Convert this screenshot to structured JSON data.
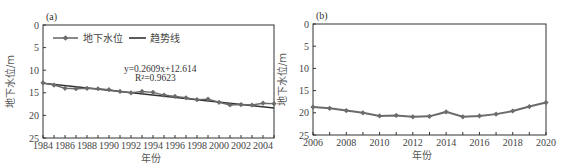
{
  "chart_data": [
    {
      "type": "line",
      "panel": "(a)",
      "title": "",
      "xlabel": "年份",
      "ylabel": "地下水位/m",
      "ylim": [
        0,
        25
      ],
      "y_inverted": true,
      "xlim": [
        1984,
        2005
      ],
      "x_ticks": [
        "1984",
        "1986",
        "1988",
        "1990",
        "1992",
        "1994",
        "1996",
        "1998",
        "2000",
        "2002",
        "2004"
      ],
      "y_ticks": [
        "0",
        "5",
        "10",
        "15",
        "20",
        "25"
      ],
      "legend": [
        "地下水位",
        "趋势线"
      ],
      "legend_position": "top-left inside",
      "annotation": {
        "equation": "y=0.2609x+12.614",
        "r2": "R²=0.9623"
      },
      "x": [
        1984,
        1985,
        1986,
        1987,
        1988,
        1989,
        1990,
        1991,
        1992,
        1993,
        1994,
        1995,
        1996,
        1997,
        1998,
        1999,
        2000,
        2001,
        2002,
        2003,
        2004,
        2005
      ],
      "series": [
        {
          "name": "地下水位",
          "marker": "diamond",
          "values": [
            12.8,
            13.3,
            14.0,
            14.1,
            14.0,
            14.1,
            14.3,
            14.7,
            15.0,
            14.7,
            14.9,
            15.5,
            15.8,
            16.1,
            16.5,
            16.4,
            17.1,
            17.7,
            17.6,
            17.7,
            17.3,
            17.4
          ]
        },
        {
          "name": "趋势线",
          "marker": "none",
          "slope": 0.2609,
          "intercept": 12.614
        }
      ],
      "grid": false
    },
    {
      "type": "line",
      "panel": "(b)",
      "title": "",
      "xlabel": "年份",
      "ylabel": "地下水位/m",
      "ylim": [
        0,
        25
      ],
      "y_inverted": true,
      "xlim": [
        2006,
        2020
      ],
      "x_ticks": [
        "2006",
        "2008",
        "2010",
        "2012",
        "2014",
        "2016",
        "2018",
        "2020"
      ],
      "y_ticks": [
        "0",
        "5",
        "10",
        "15",
        "20",
        "25"
      ],
      "x": [
        2006,
        2007,
        2008,
        2009,
        2010,
        2011,
        2012,
        2013,
        2014,
        2015,
        2016,
        2017,
        2018,
        2019,
        2020
      ],
      "series": [
        {
          "name": "地下水位",
          "marker": "diamond",
          "values": [
            18.7,
            19.0,
            19.5,
            20.0,
            20.7,
            20.6,
            20.9,
            20.8,
            19.8,
            20.9,
            20.7,
            20.3,
            19.6,
            18.6,
            17.7
          ]
        }
      ],
      "grid": false
    }
  ],
  "colors": {
    "series": "#6b6b6b",
    "trend": "#333333",
    "axis": "#333333"
  }
}
